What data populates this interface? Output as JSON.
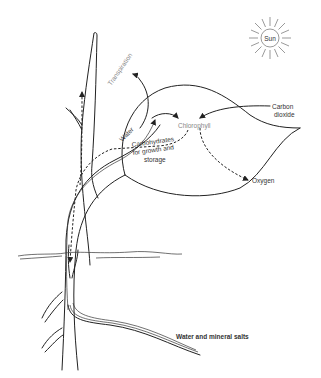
{
  "diagram": {
    "labels": {
      "sun": "Sun",
      "transpiration": "Transpiration",
      "water": "Water",
      "chlorophyll": "Chlorophyll",
      "carbon_dioxide_line1": "Carbon",
      "carbon_dioxide_line2": "dioxide",
      "carbohydrates_line1": "Carbohydrates",
      "carbohydrates_line2": "for growth and",
      "carbohydrates_line3": "storage",
      "oxygen": "Oxygen",
      "water_minerals": "Water and mineral salts"
    },
    "elements": [
      {
        "name": "sun",
        "type": "icon"
      },
      {
        "name": "stem",
        "type": "plant-part"
      },
      {
        "name": "leaf",
        "type": "plant-part"
      },
      {
        "name": "root",
        "type": "plant-part"
      },
      {
        "name": "soil-line",
        "type": "ground"
      },
      {
        "name": "xylem-flow",
        "type": "solid-arrow",
        "from": "root",
        "to": "leaf"
      },
      {
        "name": "phloem-flow",
        "type": "dashed-arrow",
        "from": "leaf",
        "to": "stem/root"
      },
      {
        "name": "co2-in",
        "type": "solid-arrow",
        "to": "chlorophyll"
      },
      {
        "name": "oxygen-out",
        "type": "dashed-arrow",
        "from": "chlorophyll"
      },
      {
        "name": "transpiration-out",
        "type": "solid-arrow",
        "from": "leaf"
      }
    ],
    "colors": {
      "ink": "#222222",
      "background": "#ffffff",
      "faint_label": "#888888"
    }
  }
}
